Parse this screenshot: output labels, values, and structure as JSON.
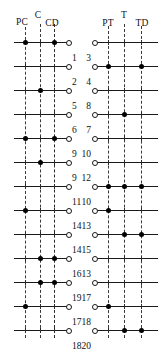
{
  "figure": {
    "width": 162,
    "height": 345,
    "background": "#ffffff",
    "ink_color": "#111111",
    "dot_color": "#000000"
  },
  "panels": [
    {
      "id": "left",
      "name": "compression-panel",
      "column_labels": [
        {
          "text": "PC",
          "x": 22,
          "y": 18
        },
        {
          "text": "C",
          "x": 38,
          "y": 11
        },
        {
          "text": "CD",
          "x": 52,
          "y": 19
        }
      ],
      "guides": [
        {
          "name": "pc-guide",
          "x": 25,
          "top": 27,
          "bottom": 338,
          "weight": "thin"
        },
        {
          "name": "c-guide",
          "x": 40,
          "top": 24,
          "bottom": 338,
          "weight": "thin"
        },
        {
          "name": "cd-guide",
          "x": 54,
          "top": 24,
          "bottom": 338,
          "weight": "thick"
        }
      ],
      "line_start": 14,
      "line_end": 68,
      "endcap_x": 68,
      "label_x": 72,
      "label_dy": 10,
      "rows": [
        {
          "y": 42,
          "label": "1",
          "dots": [
            25,
            54
          ]
        },
        {
          "y": 66,
          "label": "2",
          "dots": []
        },
        {
          "y": 90,
          "label": "5",
          "dots": [
            40
          ]
        },
        {
          "y": 114,
          "label": "6",
          "dots": []
        },
        {
          "y": 138,
          "label": "9",
          "dots": [
            25,
            54
          ]
        },
        {
          "y": 162,
          "label": "9",
          "dots": [
            40
          ]
        },
        {
          "y": 186,
          "label": "11",
          "dots": []
        },
        {
          "y": 210,
          "label": "14",
          "dots": [
            25
          ]
        },
        {
          "y": 234,
          "label": "14",
          "dots": []
        },
        {
          "y": 258,
          "label": "16",
          "dots": [
            40,
            54
          ]
        },
        {
          "y": 282,
          "label": "19",
          "dots": [
            40,
            54
          ]
        },
        {
          "y": 306,
          "label": "17",
          "dots": [
            25
          ]
        },
        {
          "y": 330,
          "label": "18",
          "dots": []
        }
      ]
    },
    {
      "id": "right",
      "name": "tension-panel",
      "column_labels": [
        {
          "text": "PT",
          "x": 108,
          "y": 19
        },
        {
          "text": "T",
          "x": 124,
          "y": 11
        },
        {
          "text": "TD",
          "x": 142,
          "y": 19
        }
      ],
      "guides": [
        {
          "name": "pt-guide",
          "x": 108,
          "top": 26,
          "bottom": 338,
          "weight": "thin"
        },
        {
          "name": "t-guide",
          "x": 124,
          "top": 24,
          "bottom": 338,
          "weight": "thin"
        },
        {
          "name": "td-guide",
          "x": 141,
          "top": 26,
          "bottom": 338,
          "weight": "thin"
        }
      ],
      "line_start": 94,
      "line_end": 158,
      "endcap_x": 94,
      "label_x": 91,
      "label_dy": 10,
      "rows": [
        {
          "y": 42,
          "label": "3",
          "dots": []
        },
        {
          "y": 66,
          "label": "4",
          "dots": [
            108,
            141
          ]
        },
        {
          "y": 90,
          "label": "8",
          "dots": []
        },
        {
          "y": 114,
          "label": "7",
          "dots": [
            124
          ]
        },
        {
          "y": 138,
          "label": "10",
          "dots": []
        },
        {
          "y": 162,
          "label": "12",
          "dots": []
        },
        {
          "y": 186,
          "label": "10",
          "dots": [
            108,
            124,
            141
          ]
        },
        {
          "y": 210,
          "label": "13",
          "dots": [
            108
          ]
        },
        {
          "y": 234,
          "label": "15",
          "dots": [
            124,
            141
          ]
        },
        {
          "y": 258,
          "label": "13",
          "dots": []
        },
        {
          "y": 282,
          "label": "17",
          "dots": []
        },
        {
          "y": 306,
          "label": "18",
          "dots": [
            108
          ]
        },
        {
          "y": 330,
          "label": "20",
          "dots": [
            124,
            141
          ]
        }
      ]
    }
  ]
}
